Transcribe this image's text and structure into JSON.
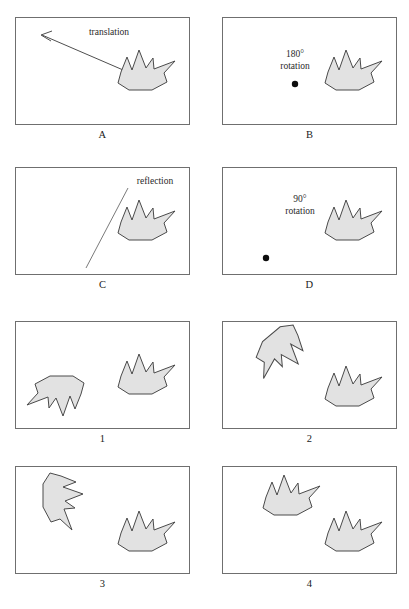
{
  "figure": {
    "title_present": false,
    "shape_fill_color": "#e2e2e2",
    "shape_stroke_color": "#4a4a4a",
    "panel_border_color": "#6f6f6f",
    "background_color": "#ffffff",
    "pivot_dot_color": "#0d0d0d"
  },
  "top_group": {
    "panels": [
      {
        "id": "A",
        "label": "A",
        "caption_lines": [
          "translation"
        ],
        "annotation_type": "arrow",
        "icon": "arrow-up-left-icon"
      },
      {
        "id": "B",
        "label": "B",
        "caption_lines": [
          "180°",
          "rotation"
        ],
        "annotation_type": "pivot-dot",
        "icon": "rotation-center-dot-icon"
      },
      {
        "id": "C",
        "label": "C",
        "caption_lines": [
          "reflection"
        ],
        "annotation_type": "mirror-line",
        "icon": "reflection-axis-icon"
      },
      {
        "id": "D",
        "label": "D",
        "caption_lines": [
          "90°",
          "rotation"
        ],
        "annotation_type": "pivot-dot",
        "icon": "rotation-center-dot-icon"
      }
    ]
  },
  "bottom_group": {
    "panels": [
      {
        "id": "1",
        "label": "1",
        "result": "shape rotated 180 degrees, placed upper-left"
      },
      {
        "id": "2",
        "label": "2",
        "result": "shape rotated about 135 degrees, placed upper-left"
      },
      {
        "id": "3",
        "label": "3",
        "result": "shape rotated about 90 degrees clockwise, placed upper-left"
      },
      {
        "id": "4",
        "label": "4",
        "result": "shape translated, same orientation, placed upper-left"
      }
    ]
  }
}
